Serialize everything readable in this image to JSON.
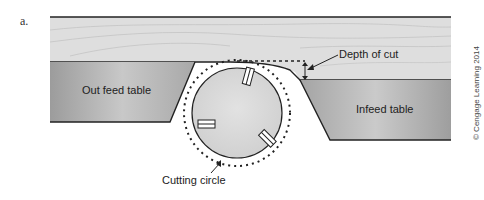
{
  "figure": {
    "letter": "a.",
    "labels": {
      "outfeed": "Out feed table",
      "infeed": "Infeed table",
      "depth": "Depth of cut",
      "cutting_circle": "Cutting circle"
    },
    "credit": "© Cengage Learning 2014"
  },
  "colors": {
    "board": "#dcdcdc",
    "table_light": "#d2d2d2",
    "table_dark": "#9a9a9a",
    "cutterhead": "#d8d8d8",
    "outline": "#222222"
  }
}
